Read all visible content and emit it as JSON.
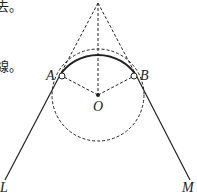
{
  "text_fragments": [
    {
      "id": "frag1",
      "text": "去。"
    },
    {
      "id": "frag2",
      "text": "。"
    },
    {
      "id": "frag3",
      "text": "線。"
    }
  ],
  "points": {
    "A": "A",
    "B": "B",
    "O": "O",
    "L": "L",
    "M": "M"
  },
  "colors": {
    "stroke": "#222222",
    "background": "#ffffff"
  }
}
